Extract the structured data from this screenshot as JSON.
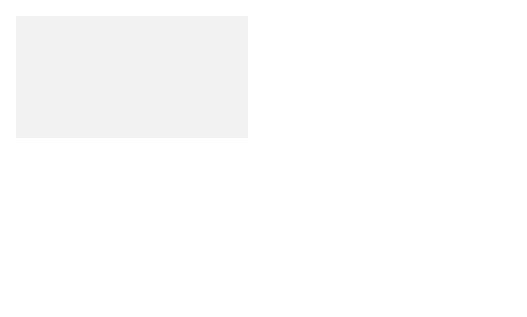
{
  "regions": {
    "matrix": "Matrix",
    "inner_membrane": [
      "Inner",
      "membrane"
    ],
    "intermembrane_space": [
      "Intermembrane",
      "space"
    ],
    "outer_membrane": [
      "Outer",
      "membrane"
    ],
    "cytosol": "Cytosol"
  },
  "labels": {
    "phosphate_transport": [
      "Phosphate",
      "transport",
      "system"
    ],
    "adp_atp_transport": [
      "ADP/ATP",
      "transport",
      "system"
    ],
    "atpase": "ATPase",
    "proton_translocase": [
      "Proton",
      "translocase"
    ]
  },
  "molecules": {
    "h_plus": "H⁺",
    "phosphate": {
      "base": "H",
      "sub1": "2",
      "mid": "PO",
      "sub2": "4",
      "sup": "−"
    },
    "adp": {
      "base": "ADP",
      "sup": "3−"
    },
    "atp": {
      "base": "ATP",
      "sup": "4−"
    }
  },
  "colors": {
    "matrix_bg": "#f2f2f2",
    "inner_membrane_bg": "#e4e4e4",
    "intermembrane_bg": "#f7f7f7",
    "outer_membrane_bg": "#cfcfcf",
    "cytosol_bg": "#e8e8e8",
    "atpase_fill": "#8a8a8a",
    "phosphate_fill": "#a6a6a6",
    "adp_fill": "#555555",
    "atp_fill": "#b8b8b8",
    "curved_arrow": "#9a9a9a",
    "h_plus_text": "#9a9a9a",
    "line": "#333333"
  }
}
